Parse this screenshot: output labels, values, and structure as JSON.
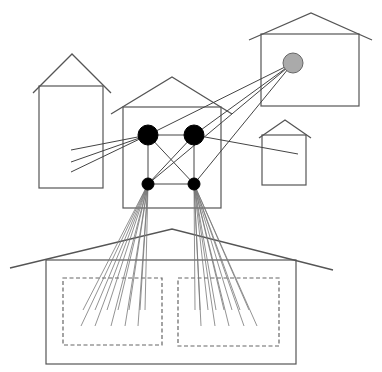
{
  "diagram": {
    "title": "",
    "colors": {
      "background": "#ffffff",
      "outline": "#555555",
      "node_dark": "#000000",
      "node_gray": "#aaaaaa",
      "node_gray_stroke": "#666666",
      "fan": "#777777"
    },
    "houses": [
      {
        "id": "left-tall-house",
        "body": {
          "x": 39,
          "y": 86,
          "w": 64,
          "h": 102
        },
        "roof": [
          [
            33,
            93
          ],
          [
            72,
            54
          ],
          [
            111,
            93
          ]
        ]
      },
      {
        "id": "center-house",
        "body": {
          "x": 123,
          "y": 107,
          "w": 98,
          "h": 101
        },
        "roof": [
          [
            111,
            114
          ],
          [
            172,
            77
          ],
          [
            232,
            114
          ]
        ]
      },
      {
        "id": "top-right-house",
        "body": {
          "x": 261,
          "y": 34,
          "w": 98,
          "h": 72
        },
        "roof": [
          [
            249,
            40
          ],
          [
            311,
            13
          ],
          [
            372,
            40
          ]
        ]
      },
      {
        "id": "small-right-house",
        "body": {
          "x": 262,
          "y": 135,
          "w": 44,
          "h": 50
        },
        "roof": [
          [
            259,
            138
          ],
          [
            285,
            120
          ],
          [
            311,
            138
          ]
        ]
      },
      {
        "id": "bottom-wide-house",
        "body": {
          "x": 46,
          "y": 260,
          "w": 250,
          "h": 104
        },
        "roof": [
          [
            10,
            268
          ],
          [
            172,
            229
          ],
          [
            333,
            270
          ]
        ]
      }
    ],
    "dashed_zones": [
      {
        "id": "zone-left",
        "x": 63,
        "y": 278,
        "w": 99,
        "h": 67
      },
      {
        "id": "zone-right",
        "x": 178,
        "y": 278,
        "w": 101,
        "h": 68
      }
    ],
    "nodes": [
      {
        "id": "hub-top-left",
        "cx": 148,
        "cy": 135,
        "r": 10,
        "fill": "#000000"
      },
      {
        "id": "hub-top-right",
        "cx": 194,
        "cy": 135,
        "r": 10,
        "fill": "#000000"
      },
      {
        "id": "hub-bottom-left",
        "cx": 148,
        "cy": 184,
        "r": 6,
        "fill": "#000000"
      },
      {
        "id": "hub-bottom-right",
        "cx": 194,
        "cy": 184,
        "r": 6,
        "fill": "#000000"
      },
      {
        "id": "remote-gray",
        "cx": 293,
        "cy": 63,
        "r": 10,
        "fill": "#aaaaaa"
      }
    ],
    "links": [
      [
        148,
        135,
        194,
        135
      ],
      [
        148,
        135,
        148,
        184
      ],
      [
        194,
        135,
        194,
        184
      ],
      [
        148,
        184,
        194,
        184
      ],
      [
        148,
        135,
        194,
        184
      ],
      [
        194,
        135,
        148,
        184
      ],
      [
        293,
        63,
        148,
        135
      ],
      [
        293,
        63,
        194,
        135
      ],
      [
        293,
        63,
        148,
        184
      ],
      [
        293,
        63,
        194,
        184
      ],
      [
        148,
        135,
        71,
        150
      ],
      [
        148,
        135,
        71,
        162
      ],
      [
        148,
        135,
        71,
        172
      ],
      [
        194,
        135,
        298,
        154
      ]
    ],
    "fans": [
      {
        "id": "fan-left",
        "origin": [
          148,
          184
        ],
        "ends": [
          [
            83,
            310
          ],
          [
            95,
            310
          ],
          [
            107,
            310
          ],
          [
            118,
            310
          ],
          [
            129,
            310
          ],
          [
            140,
            310
          ],
          [
            145,
            310
          ],
          [
            81,
            326
          ],
          [
            95,
            326
          ],
          [
            111,
            326
          ],
          [
            125,
            326
          ],
          [
            138,
            326
          ]
        ]
      },
      {
        "id": "fan-right",
        "origin": [
          194,
          184
        ],
        "ends": [
          [
            195,
            310
          ],
          [
            200,
            310
          ],
          [
            208,
            310
          ],
          [
            216,
            310
          ],
          [
            224,
            310
          ],
          [
            232,
            310
          ],
          [
            240,
            310
          ],
          [
            249,
            310
          ],
          [
            201,
            326
          ],
          [
            215,
            326
          ],
          [
            229,
            326
          ],
          [
            244,
            326
          ],
          [
            257,
            326
          ]
        ]
      }
    ]
  }
}
